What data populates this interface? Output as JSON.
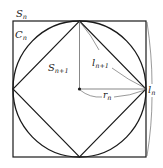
{
  "diagram": {
    "labels": {
      "outer_square": {
        "main": "S",
        "sub": "n"
      },
      "circle": {
        "main": "C",
        "sub": "n"
      },
      "inner_square": {
        "main": "S",
        "sub": "n+1"
      },
      "inner_side": {
        "main": "l",
        "sub": "n+1"
      },
      "radius": {
        "main": "r",
        "sub": "n"
      },
      "outer_side": {
        "main": "l",
        "sub": "n"
      }
    },
    "colors": {
      "stroke": "#1a1a1a",
      "thin": "#555555",
      "background": "#ffffff"
    }
  }
}
